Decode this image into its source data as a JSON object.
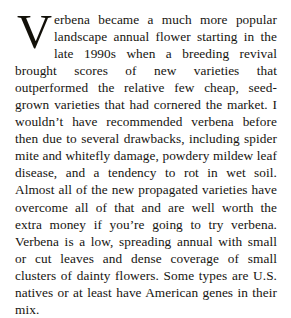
{
  "document": {
    "type": "book-paragraph",
    "background_color": "#ffffff",
    "text_color": "#16140f",
    "dropcap": {
      "letter": "V",
      "spans_lines": 3,
      "color": "#121009"
    },
    "paragraph": {
      "first_word_remainder": "erbena",
      "full_text": "Verbena became a much more popular landscape annual flower starting in the late 1990s when a breeding revival brought scores of new varieties that outperformed the relative few cheap, seed-grown varieties that had cornered the market. I wouldn't have recommended verbena before then due to several drawbacks, including spider mite and whitefly damage, powdery mildew leaf disease, and a tendency to rot in wet soil. Almost all of the new propagated varieties have overcome all of that and are well worth the extra money if you're going to try verbena. Verbena is a low, spreading annual with small or cut leaves and dense coverage of small clusters of dainty flowers. Some types are U.S. natives or at least have American genes in their mix.",
      "body_after_dropcap": "erbena became a much more popular landscape annual flower starting in the late 1990s when a breeding revival brought scores of new varieties that outperformed the relative few cheap, seed-grown varieties that had cornered the market. I wouldn’t have recommended verbena before then due to several drawbacks, including spider mite and whitefly damage, powdery mildew leaf disease, and a tendency to rot in wet soil. Almost all of the new propagated varieties have overcome all of that and are well worth the extra money if you’re going to try verbena. Verbena is a low, spreading annual with small or cut leaves and dense coverage of small clusters of dainty flowers. Some types are U.S. natives or at least have American genes in their mix.",
      "lines": [
        "erbena became a much more popular land-",
        "scape annual flower starting in the late 1990s",
        "when a breeding revival brought scores of",
        "new varieties that outperformed the relative few",
        "cheap, seed-grown varieties that had cornered the",
        "market. I wouldn’t have recommended verbena",
        "before then due to several drawbacks, including spi-",
        "der mite and whitefly damage, powdery mildew leaf",
        "disease, and a tendency to rot in wet soil. Almost all",
        "of the new propagated varieties have overcome all",
        "of that and are well worth the extra money if you’re",
        "going to try verbena. Verbena is a low, spreading",
        "annual with small or cut leaves and dense cover-",
        "age of small clusters of dainty flowers. Some types",
        "are U.S. natives or at least have American genes in",
        "their mix."
      ],
      "line_count": 16,
      "alignment": "justified"
    }
  }
}
